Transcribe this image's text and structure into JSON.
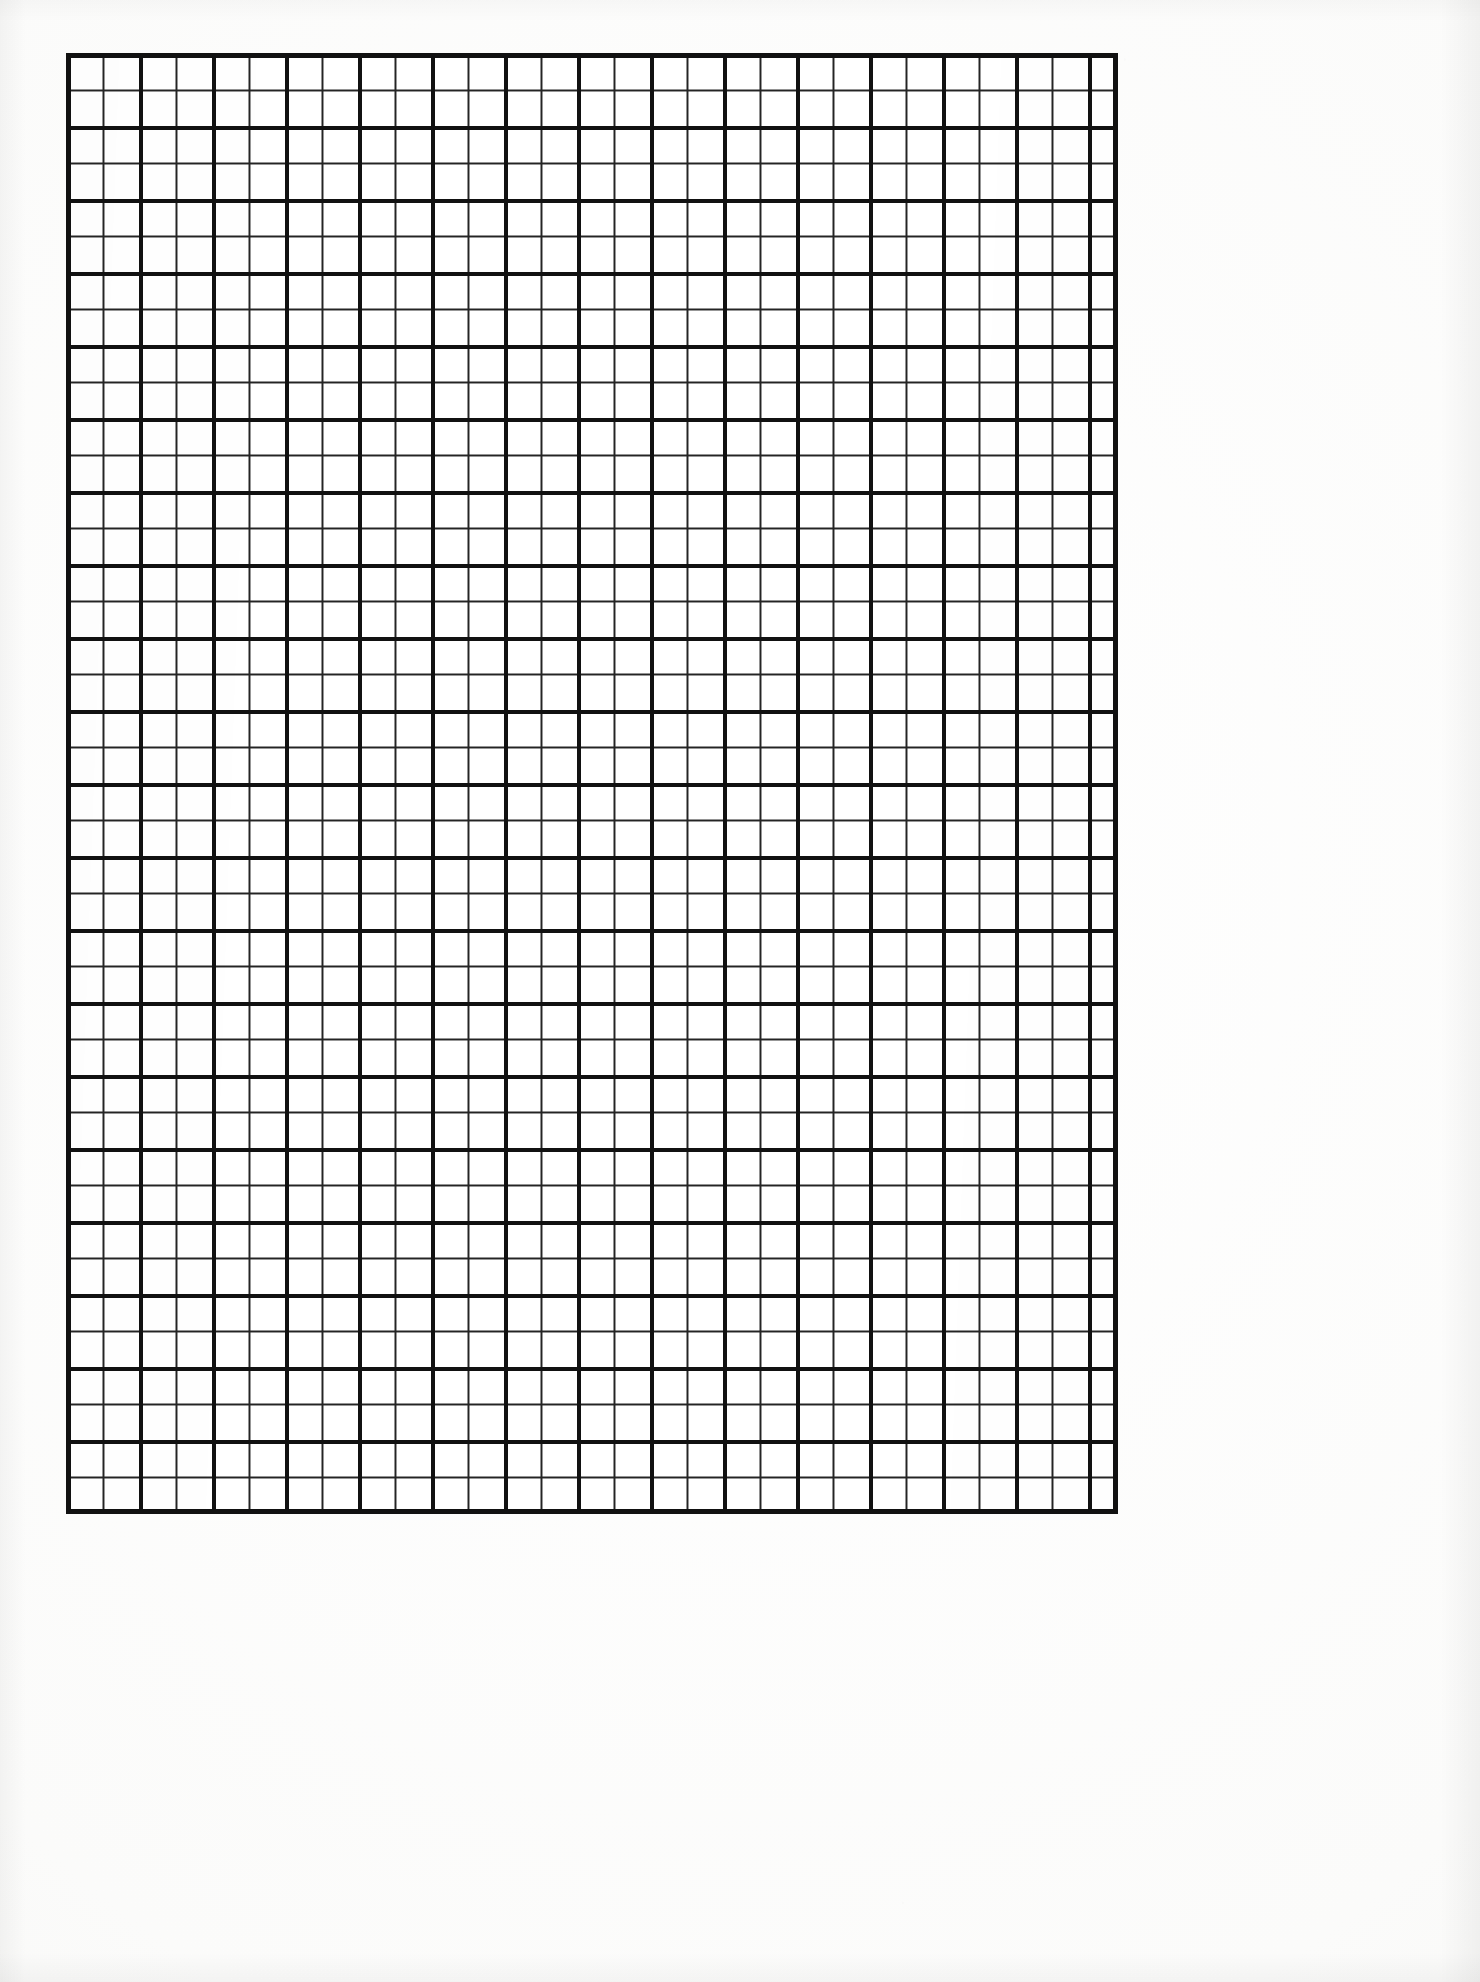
{
  "document": {
    "kind": "graph-paper-scan",
    "title": "Blank Graph Paper Sheet",
    "caption": "Scanned blank quadrille / graph paper with bold ruling every 2 squares",
    "page_width_px": 1480,
    "page_height_px": 1982,
    "background_color": "#fdfdfc",
    "paper_color": "#ffffff",
    "ink_color": "#1c1c1c"
  },
  "grid": {
    "name": "quadrille-grid",
    "left_px": 66,
    "top_px": 53,
    "width_px": 1052,
    "height_px": 1461,
    "minor_cell_px": 36.5,
    "major_every_n_cells": 2,
    "major_cell_px": 73,
    "columns_minor": 28,
    "rows_minor": 40,
    "columns_major": 14,
    "rows_major": 20,
    "minor_line_width_px": 2,
    "major_line_width_px": 4,
    "frame_line_width_px": 5,
    "minor_line_color": "#242424",
    "major_line_color": "#111111",
    "frame_line_color": "#111111"
  },
  "margins": {
    "left_px": 66,
    "right_px": 362,
    "top_px": 53,
    "bottom_px": 468
  },
  "annotations": {
    "text_present": "none",
    "labels": []
  }
}
